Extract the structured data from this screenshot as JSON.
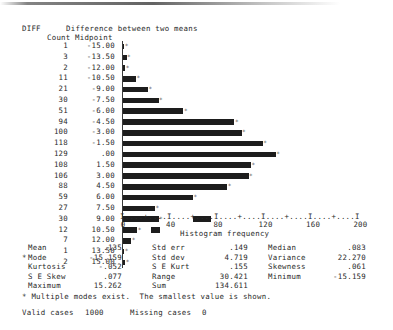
{
  "header": {
    "variable_name": "DIFF",
    "variable_label": "Difference between two means",
    "count_header": "Count",
    "midpoint_header": "Midpoint"
  },
  "chart_data": {
    "type": "bar",
    "orientation": "horizontal",
    "title": "Difference between two means",
    "xlabel": "Histogram frequency",
    "ylabel": "Midpoint",
    "xlim": [
      0,
      200
    ],
    "xticks": [
      0,
      40,
      80,
      120,
      160,
      200
    ],
    "xtick_labels": [
      "0",
      "40",
      "80",
      "120",
      "160",
      "200"
    ],
    "axis_ruler": "I....+....I....+....I....+....I....+....I....+....I",
    "grid": false,
    "legend": null,
    "categories": [
      "-15.00",
      "-13.50",
      "-12.00",
      "-10.50",
      "-9.00",
      "-7.50",
      "-6.00",
      "-4.50",
      "-3.00",
      "-1.50",
      ".00",
      "1.50",
      "3.00",
      "4.50",
      "6.00",
      "7.50",
      "9.00",
      "10.50",
      "12.00",
      "13.50",
      "15.00"
    ],
    "values": [
      1,
      3,
      2,
      11,
      21,
      30,
      51,
      94,
      100,
      118,
      129,
      108,
      106,
      88,
      59,
      27,
      30,
      12,
      7,
      1,
      2
    ]
  },
  "statistics": {
    "rows": [
      {
        "c1_label": "Mean",
        "c1_value": ".135",
        "c2_label": "Std err",
        "c2_value": ".149",
        "c3_label": "Median",
        "c3_value": ".083"
      },
      {
        "c1_label": "Mode",
        "c1_value": "-15.159",
        "c2_label": "Std dev",
        "c2_value": "4.719",
        "c3_label": "Variance",
        "c3_value": "22.270"
      },
      {
        "c1_label": "Kurtosis",
        "c1_value": "-.052",
        "c2_label": "S E Kurt",
        "c2_value": ".155",
        "c3_label": "Skewness",
        "c3_value": ".061"
      },
      {
        "c1_label": "S E Skew",
        "c1_value": ".077",
        "c2_label": "Range",
        "c2_value": "30.421",
        "c3_label": "Minimum",
        "c3_value": "-15.159"
      },
      {
        "c1_label": "Maximum",
        "c1_value": "15.262",
        "c2_label": "Sum",
        "c2_value": "134.611",
        "c3_label": "",
        "c3_value": ""
      }
    ],
    "mode_marker": "*"
  },
  "footnotes": {
    "multiple_modes": "* Multiple modes exist.  The smallest value is shown.",
    "valid_cases_label": "Valid cases",
    "valid_cases_value": "1000",
    "missing_cases_label": "Missing cases",
    "missing_cases_value": "0"
  },
  "bar_star": "*"
}
